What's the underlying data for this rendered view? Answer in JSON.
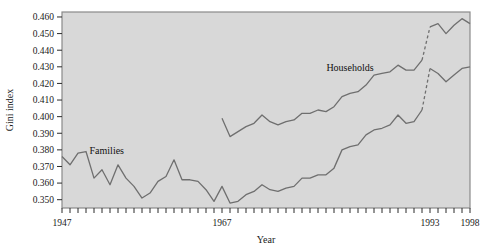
{
  "chart_data": {
    "type": "line",
    "title": "",
    "xlabel": "Year",
    "ylabel": "Gini index",
    "xlim": [
      1947,
      1998
    ],
    "ylim": [
      0.345,
      0.463
    ],
    "ytick_labels": [
      "0.460",
      "0.450",
      "0.440",
      "0.430",
      "0.420",
      "0.410",
      "0.400",
      "0.390",
      "0.380",
      "0.370",
      "0.360",
      "0.350"
    ],
    "ytick_values": [
      0.46,
      0.45,
      0.44,
      0.43,
      0.42,
      0.41,
      0.4,
      0.39,
      0.38,
      0.37,
      0.36,
      0.35
    ],
    "xtick_labels": [
      "1947",
      "1967",
      "1993",
      "1998"
    ],
    "xtick_values": [
      1947,
      1967,
      1993,
      1998
    ],
    "xtick_minor_start": 1947,
    "xtick_minor_end": 1998,
    "grid": false,
    "legend_position": "inline-annotations",
    "line_color": "#6f6f6f",
    "plot_background": "#d8d8d8",
    "plot_border_color": "#8a8a8a",
    "annotations": [
      {
        "text": "Families",
        "x": 1952.6,
        "y": 0.3775
      },
      {
        "text": "Households",
        "x": 1983.0,
        "y": 0.4275
      }
    ],
    "break_year": 1993,
    "break_note": "dashed segments indicate 1992-1993 survey methodology break",
    "series": [
      {
        "name": "Families",
        "style": "solid",
        "x": [
          1947,
          1948,
          1949,
          1950,
          1951,
          1952,
          1953,
          1954,
          1955,
          1956,
          1957,
          1958,
          1959,
          1960,
          1961,
          1962,
          1963,
          1964,
          1965,
          1966,
          1967,
          1968,
          1969,
          1970,
          1971,
          1972,
          1973,
          1974,
          1975,
          1976,
          1977,
          1978,
          1979,
          1980,
          1981,
          1982,
          1983,
          1984,
          1985,
          1986,
          1987,
          1988,
          1989,
          1990,
          1991,
          1992
        ],
        "values": [
          0.376,
          0.371,
          0.378,
          0.379,
          0.363,
          0.368,
          0.359,
          0.371,
          0.363,
          0.358,
          0.351,
          0.354,
          0.361,
          0.364,
          0.374,
          0.362,
          0.362,
          0.361,
          0.356,
          0.349,
          0.358,
          0.348,
          0.349,
          0.353,
          0.355,
          0.359,
          0.356,
          0.355,
          0.357,
          0.358,
          0.363,
          0.363,
          0.365,
          0.365,
          0.369,
          0.38,
          0.382,
          0.383,
          0.389,
          0.392,
          0.393,
          0.395,
          0.401,
          0.396,
          0.397,
          0.404
        ],
        "break_from": {
          "x": 1992,
          "y": 0.404
        },
        "break_to": {
          "x": 1993,
          "y": 0.429
        },
        "post_break_x": [
          1993,
          1994,
          1995,
          1996,
          1997,
          1998
        ],
        "post_break_values": [
          0.429,
          0.426,
          0.421,
          0.425,
          0.429,
          0.43
        ]
      },
      {
        "name": "Households",
        "style": "solid",
        "x": [
          1967,
          1968,
          1969,
          1970,
          1971,
          1972,
          1973,
          1974,
          1975,
          1976,
          1977,
          1978,
          1979,
          1980,
          1981,
          1982,
          1983,
          1984,
          1985,
          1986,
          1987,
          1988,
          1989,
          1990,
          1991,
          1992
        ],
        "values": [
          0.399,
          0.388,
          0.391,
          0.394,
          0.396,
          0.401,
          0.397,
          0.395,
          0.397,
          0.398,
          0.402,
          0.402,
          0.404,
          0.403,
          0.406,
          0.412,
          0.414,
          0.415,
          0.419,
          0.425,
          0.426,
          0.427,
          0.431,
          0.428,
          0.428,
          0.434
        ],
        "break_from": {
          "x": 1992,
          "y": 0.434
        },
        "break_to": {
          "x": 1993,
          "y": 0.454
        },
        "post_break_x": [
          1993,
          1994,
          1995,
          1996,
          1997,
          1998
        ],
        "post_break_values": [
          0.454,
          0.456,
          0.45,
          0.455,
          0.459,
          0.456
        ]
      }
    ]
  }
}
